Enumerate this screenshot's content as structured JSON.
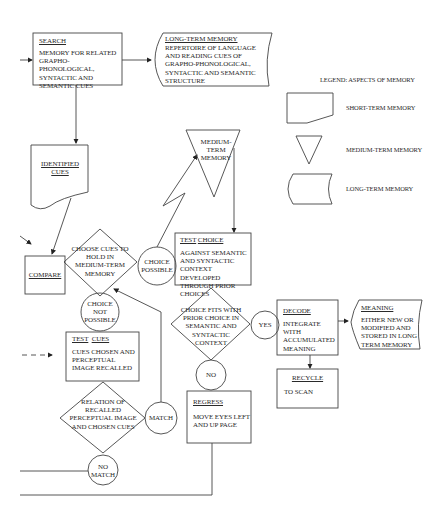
{
  "legend": {
    "title": "LEGEND: ASPECTS OF MEMORY",
    "items": [
      {
        "shape": "short-term",
        "label": "SHORT-TERM MEMORY"
      },
      {
        "shape": "medium-term",
        "label": "MEDIUM-TERM MEMORY"
      },
      {
        "shape": "long-term",
        "label": "LONG-TERM MEMORY"
      }
    ]
  },
  "nodes": {
    "search": {
      "title": "SEARCH",
      "body": "MEMORY FOR RELATED GRAPHO-PHONOLOGICAL, SYNTACTIC AND SEMANTIC  CUES"
    },
    "long_term": {
      "title": "LONG-TERM  MEMORY",
      "body": "REPERTOIRE OF LANGUAGE AND READING CUES OF GRAPHO-PHONOLOGICAL, SYNTACTIC AND SEMANTIC STRUCTURE"
    },
    "identified_cues": {
      "title": "IDENTIFIED CUES"
    },
    "medium_term": {
      "title": "MEDIUM-TERM MEMORY"
    },
    "compare": {
      "title": "COMPARE"
    },
    "choose_cues": {
      "text": "CHOOSE CUES TO HOLD IN MEDIUM-TERM MEMORY"
    },
    "choice_possible": {
      "text": "CHOICE POSSIBLE"
    },
    "test_choice": {
      "title1": "TEST",
      "title2": "CHOICE",
      "body": "AGAINST SEMANTIC AND SYNTACTIC CONTEXT DEVELOPED THROUGH PRIOR CHOICES"
    },
    "choice_not_possible": {
      "text": "CHOICE NOT POSSIBLE"
    },
    "choice_fits": {
      "text": "CHOICE FITS WITH PRIOR CHOICE IN SEMANTIC AND SYNTACTIC CONTEXT"
    },
    "yes": {
      "text": "YES"
    },
    "decode": {
      "title": "DECODE",
      "body": "INTEGRATE WITH ACCUMULATED MEANING"
    },
    "meaning": {
      "title": "MEANING",
      "body": "EITHER NEW OR MODIFIED AND STORED IN LONG TERM MEMORY"
    },
    "test_cues": {
      "title1": "TEST",
      "title2": "CUES",
      "body": "CUES CHOSEN AND PERCEPTUAL IMAGE RECALLED"
    },
    "recycle": {
      "title": "RECYCLE",
      "body": "TO SCAN"
    },
    "no": {
      "text": "NO"
    },
    "relation": {
      "text": "RELATION OF RECALLED PERCEPTUAL IMAGE AND CHOSEN CUES"
    },
    "match": {
      "text": "MATCH"
    },
    "regress": {
      "title": "REGRESS",
      "body": "MOVE EYES LEFT AND UP PAGE"
    },
    "no_match": {
      "text": "NO MATCH"
    }
  }
}
